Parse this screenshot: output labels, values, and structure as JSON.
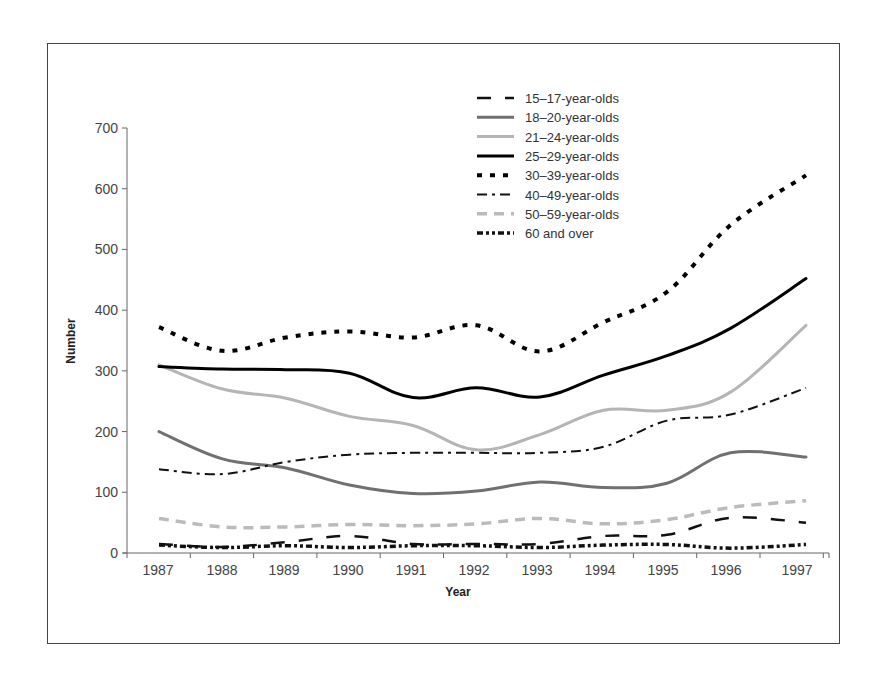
{
  "chart_data": {
    "type": "line",
    "title": "",
    "xlabel": "Year",
    "ylabel": "Number",
    "ylim": [
      0,
      700
    ],
    "yticks": [
      0,
      100,
      200,
      300,
      400,
      500,
      600,
      700
    ],
    "grid": false,
    "legend_position": "top-right inside",
    "categories": [
      "1987",
      "1988",
      "1989",
      "1990",
      "1991",
      "1992",
      "1993",
      "1994",
      "1995",
      "1996",
      "1997"
    ],
    "series": [
      {
        "name": "15–17-year-olds",
        "style": "long-dash",
        "color": "#111111",
        "values": [
          15,
          10,
          18,
          28,
          15,
          15,
          15,
          28,
          30,
          58,
          50
        ]
      },
      {
        "name": "18–20-year-olds",
        "style": "solid",
        "color": "#707070",
        "values": [
          200,
          155,
          140,
          112,
          98,
          102,
          117,
          108,
          115,
          165,
          158
        ]
      },
      {
        "name": "21–24-year-olds",
        "style": "solid",
        "color": "#b5b5b5",
        "values": [
          310,
          270,
          255,
          225,
          210,
          170,
          195,
          235,
          235,
          265,
          375
        ]
      },
      {
        "name": "25–29-year-olds",
        "style": "solid",
        "color": "#000000",
        "values": [
          307,
          303,
          302,
          296,
          256,
          272,
          257,
          293,
          325,
          370,
          452
        ]
      },
      {
        "name": "30–39-year-olds",
        "style": "dotted-square",
        "color": "#000000",
        "values": [
          372,
          333,
          355,
          365,
          355,
          375,
          332,
          380,
          430,
          540,
          622
        ]
      },
      {
        "name": "40–49-year-olds",
        "style": "dash-dot",
        "color": "#111111",
        "values": [
          138,
          130,
          150,
          162,
          165,
          165,
          165,
          175,
          218,
          228,
          272
        ]
      },
      {
        "name": "50–59-year-olds",
        "style": "dashed",
        "color": "#bbbbbb",
        "values": [
          57,
          43,
          43,
          47,
          45,
          48,
          57,
          48,
          55,
          75,
          86
        ]
      },
      {
        "name": "60 and over",
        "style": "dash-dot-dot",
        "color": "#111111",
        "values": [
          13,
          9,
          12,
          9,
          12,
          12,
          9,
          13,
          14,
          8,
          14
        ]
      }
    ]
  },
  "axes": {
    "y_title": "Number",
    "x_title": "Year",
    "y_tick_labels": [
      "0",
      "100",
      "200",
      "300",
      "400",
      "500",
      "600",
      "700"
    ],
    "x_tick_labels": [
      "1987",
      "1988",
      "1989",
      "1990",
      "1991",
      "1992",
      "1993",
      "1994",
      "1995",
      "1996",
      "1997"
    ]
  },
  "legend": {
    "items": [
      {
        "label": "15–17-year-olds"
      },
      {
        "label": "18–20-year-olds"
      },
      {
        "label": "21–24-year-olds"
      },
      {
        "label": "25–29-year-olds"
      },
      {
        "label": "30–39-year-olds"
      },
      {
        "label": "40–49-year-olds"
      },
      {
        "label": "50–59-year-olds"
      },
      {
        "label": "60 and over"
      }
    ]
  }
}
